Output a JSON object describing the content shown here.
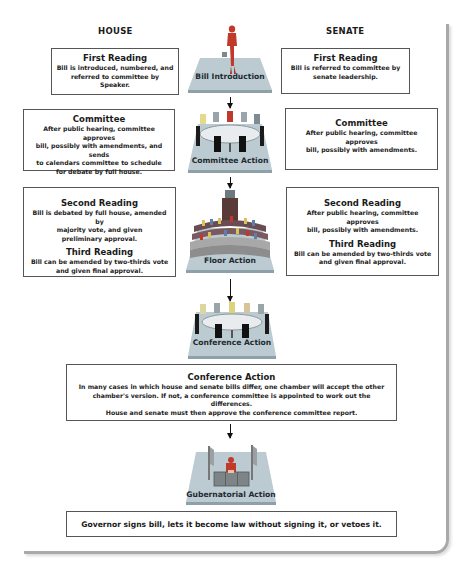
{
  "columns": {
    "house": "HOUSE",
    "senate": "SENATE"
  },
  "stages": [
    {
      "id": "bill-introduction",
      "label": "Bill Introduction",
      "icon": "presenter-icon"
    },
    {
      "id": "committee-action",
      "label": "Committee Action",
      "icon": "committee-table-icon"
    },
    {
      "id": "floor-action",
      "label": "Floor Action",
      "icon": "legislative-chamber-icon"
    },
    {
      "id": "conference-action",
      "label": "Conference Action",
      "icon": "conference-table-icon"
    },
    {
      "id": "gubernatorial-action",
      "label": "Gubernatorial Action",
      "icon": "governor-desk-icon"
    }
  ],
  "house": {
    "first_reading": {
      "title": "First Reading",
      "lines": [
        "Bill is introduced, numbered, and",
        "referred to committee by Speaker."
      ]
    },
    "committee": {
      "title": "Committee",
      "lines": [
        "After public hearing, committee approves",
        "bill, possibly with amendments, and sends",
        "to calendars committee to schedule",
        "for debate by full house."
      ]
    },
    "second_reading": {
      "title": "Second Reading",
      "lines": [
        "Bill is debated by full house, amended by",
        "majority vote, and given",
        "preliminary approval."
      ]
    },
    "third_reading": {
      "title": "Third Reading",
      "lines": [
        "Bill can be amended by two-thirds vote",
        "and given final approval."
      ]
    }
  },
  "senate": {
    "first_reading": {
      "title": "First Reading",
      "lines": [
        "Bill is referred to committee by",
        "senate leadership."
      ]
    },
    "committee": {
      "title": "Committee",
      "lines": [
        "After public hearing, committee approves",
        "bill, possibly with amendments."
      ]
    },
    "second_reading": {
      "title": "Second Reading",
      "lines": [
        "After public hearing, committee approves",
        "bill, possibly with amendments."
      ]
    },
    "third_reading": {
      "title": "Third Reading",
      "lines": [
        "Bill can be amended by two-thirds vote",
        "and given final approval."
      ]
    }
  },
  "conference": {
    "title": "Conference Action",
    "lines": [
      "In many cases in which house and senate bills differ, one chamber will accept the other",
      "chamber's version. If not, a conference committee is appointed to work out the differences.",
      "House and senate must then approve the conference committee report."
    ]
  },
  "governor": {
    "text": "Governor signs bill, lets it become law without signing it, or vetoes it."
  },
  "colors": {
    "platform": "#b9c8cf",
    "platform_edge": "#8fa1a8",
    "frame": "#a9a9a9",
    "accent_red": "#c0392b"
  }
}
